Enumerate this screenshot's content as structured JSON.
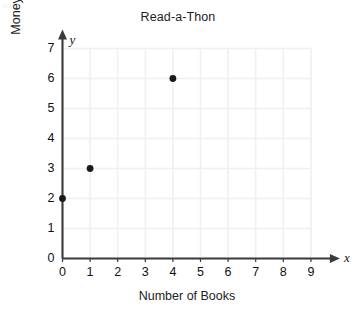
{
  "chart_data": {
    "type": "scatter",
    "title": "Read-a-Thon",
    "xlabel": "Number of Books",
    "ylabel": "Money (in dollars)",
    "x_axis_letter": "x",
    "y_axis_letter": "y",
    "xlim": [
      0,
      9
    ],
    "ylim": [
      0,
      7
    ],
    "xticks": [
      0,
      1,
      2,
      3,
      4,
      5,
      6,
      7,
      8,
      9
    ],
    "yticks": [
      0,
      1,
      2,
      3,
      4,
      5,
      6,
      7
    ],
    "xtick_labels": [
      "0",
      "1",
      "2",
      "3",
      "4",
      "5",
      "6",
      "7",
      "8",
      "9"
    ],
    "ytick_labels": [
      "0",
      "1",
      "2",
      "3",
      "4",
      "5",
      "6",
      "7"
    ],
    "grid": true,
    "grid_color": "#f0f0f0",
    "axis_color": "#3b3b3b",
    "point_color": "#1a1a1a",
    "legend": null,
    "points": [
      {
        "x": 0,
        "y": 2
      },
      {
        "x": 1,
        "y": 3
      },
      {
        "x": 4,
        "y": 6
      }
    ],
    "series": [
      {
        "name": "Read-a-Thon",
        "x": [
          0,
          1,
          4
        ],
        "values": [
          2,
          3,
          6
        ]
      }
    ]
  },
  "artifact": {
    "top_left_text": "uuu"
  }
}
